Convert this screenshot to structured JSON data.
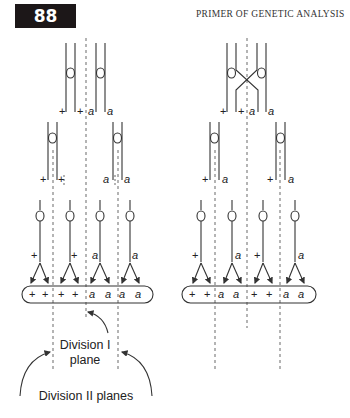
{
  "header": {
    "page_number": "88",
    "running_title": "PRIMER OF GENETIC ANALYSIS"
  },
  "diagram": {
    "left_panel": {
      "parental_labels": [
        "+",
        "+",
        "a",
        "a"
      ],
      "dyad_labels": [
        [
          "+",
          "+"
        ],
        [
          "a",
          "a"
        ]
      ],
      "monad_labels": [
        "+",
        "+",
        "a",
        "a"
      ],
      "spore_labels": [
        "+",
        "+",
        "+",
        "+",
        "a",
        "a",
        "a",
        "a"
      ]
    },
    "right_panel": {
      "parental_labels": [
        "+",
        "+",
        "a",
        "a"
      ],
      "dyad_labels": [
        [
          "+",
          "a"
        ],
        [
          "+",
          "a"
        ]
      ],
      "monad_labels": [
        "+",
        "a",
        "+",
        "a"
      ],
      "spore_labels": [
        "+",
        "+",
        "a",
        "a",
        "+",
        "+",
        "a",
        "a"
      ]
    },
    "annotations": {
      "division_1_line1": "Division I",
      "division_1_line2": "plane",
      "division_2": "Division II planes"
    }
  }
}
